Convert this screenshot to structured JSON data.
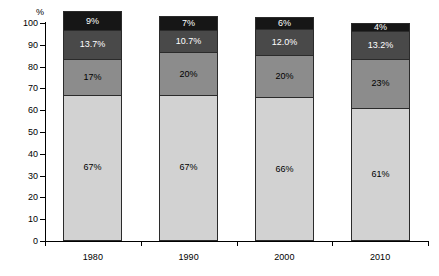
{
  "chart_data": {
    "type": "bar",
    "stacked": true,
    "title": "",
    "xlabel": "",
    "ylabel": "%",
    "y_unit_label": "%",
    "categories": [
      "1980",
      "1990",
      "2000",
      "2010"
    ],
    "ylim": [
      0,
      100
    ],
    "yticks": [
      0,
      10,
      20,
      30,
      40,
      50,
      60,
      70,
      80,
      90,
      100
    ],
    "ytick_labels": [
      "0",
      "10",
      "20",
      "30",
      "40",
      "50",
      "60",
      "70",
      "80",
      "90",
      "100"
    ],
    "grid": false,
    "legend": "none",
    "series": [
      {
        "name": "segment-1-bottom",
        "color": "#d2d2d2",
        "label_color": "#000000",
        "values": [
          67,
          67,
          66,
          61
        ],
        "labels": [
          "67%",
          "67%",
          "66%",
          "61%"
        ]
      },
      {
        "name": "segment-2",
        "color": "#8c8c8c",
        "label_color": "#000000",
        "values": [
          17,
          20,
          20,
          23
        ],
        "labels": [
          "17%",
          "20%",
          "20%",
          "23%"
        ]
      },
      {
        "name": "segment-3",
        "color": "#494949",
        "label_color": "#ffffff",
        "values": [
          13.7,
          10.7,
          12.0,
          13.2
        ],
        "labels": [
          "13.7%",
          "10.7%",
          "12.0%",
          "13.2%"
        ]
      },
      {
        "name": "segment-4-top",
        "color": "#161616",
        "label_color": "#ffffff",
        "values": [
          9,
          7,
          6,
          4
        ],
        "labels": [
          "9%",
          "7%",
          "6%",
          "4%"
        ]
      }
    ]
  },
  "axis": {
    "unit": "%"
  }
}
